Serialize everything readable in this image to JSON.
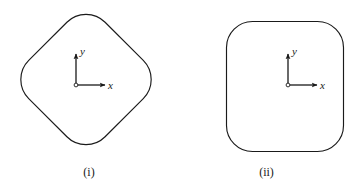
{
  "page": {
    "background_color": "#ffffff",
    "ink_color": "#1a1a1a",
    "width": 355,
    "height": 187
  },
  "figures": [
    {
      "id": "figure-i",
      "caption": "(i)",
      "shape_name": "rounded-diamond-cross-section",
      "shape_description": "rounded diamond (square rotated 45 degrees with rounded corners)",
      "bounds": {
        "left": 10,
        "top": 3,
        "right": 162,
        "bottom": 156
      },
      "center": {
        "x": 86,
        "y": 80
      },
      "corner_radius": 26,
      "rotation_deg": 45,
      "stroke_color": "#1a1a1a",
      "stroke_width": 1.1,
      "axes": {
        "name": "coordinate-axes",
        "origin": {
          "x": 76,
          "y": 85
        },
        "x_axis": {
          "label": "x",
          "length": 30,
          "direction": "right"
        },
        "y_axis": {
          "label": "y",
          "length": 32,
          "direction": "up"
        },
        "origin_marker": "open-circle"
      }
    },
    {
      "id": "figure-ii",
      "caption": "(ii)",
      "shape_name": "rounded-square-cross-section",
      "shape_description": "rounded square (axis aligned with rounded corners)",
      "bounds": {
        "left": 226,
        "top": 21,
        "right": 344,
        "bottom": 152
      },
      "center": {
        "x": 285,
        "y": 86
      },
      "corner_radius": 26,
      "rotation_deg": 0,
      "stroke_color": "#1a1a1a",
      "stroke_width": 1.1,
      "axes": {
        "name": "coordinate-axes",
        "origin": {
          "x": 288,
          "y": 85
        },
        "x_axis": {
          "label": "x",
          "length": 30,
          "direction": "right"
        },
        "y_axis": {
          "label": "y",
          "length": 32,
          "direction": "up"
        },
        "origin_marker": "open-circle"
      }
    }
  ]
}
